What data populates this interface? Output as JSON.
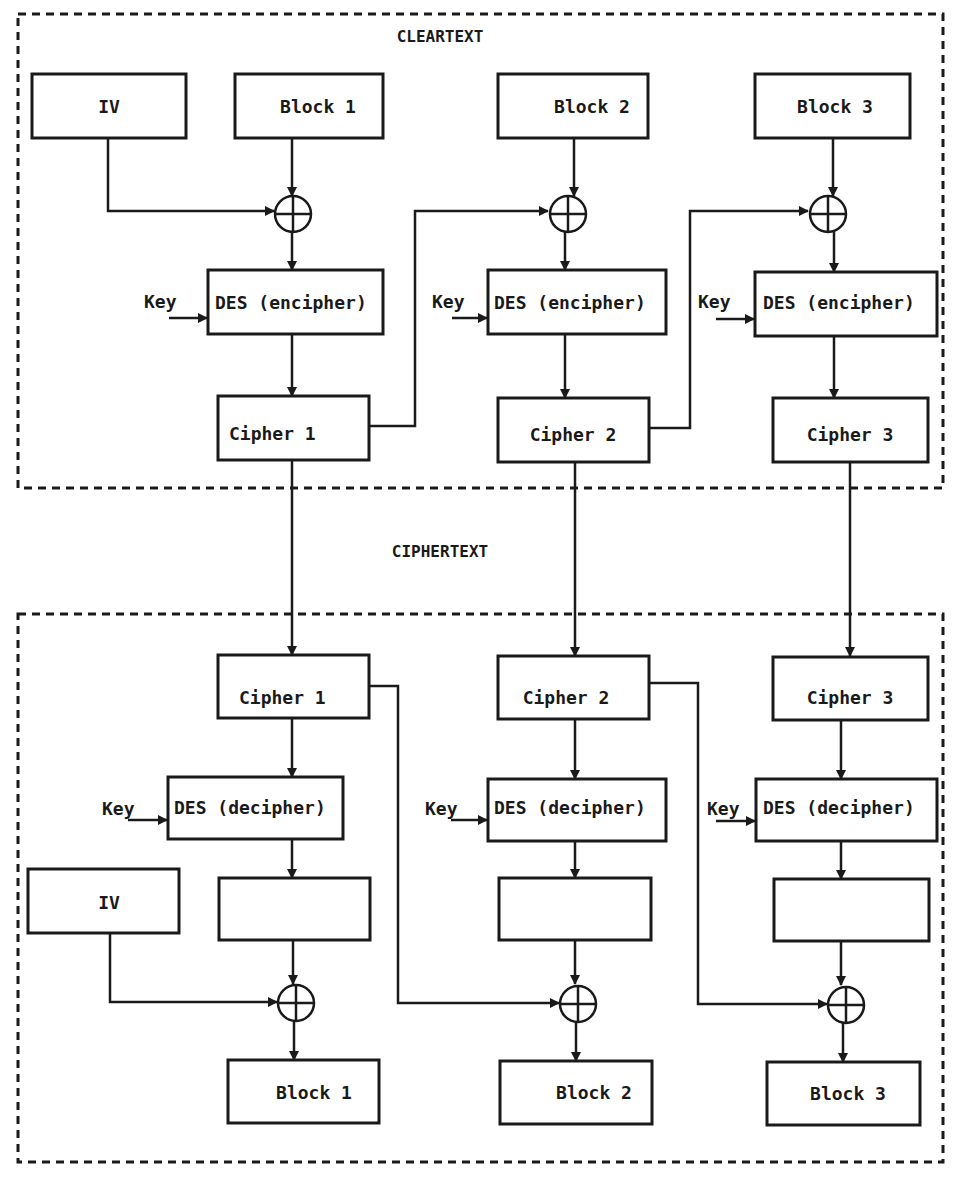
{
  "diagram": {
    "type": "CBC mode DES encipher / decipher",
    "colors": {
      "ink": "#1a1a1a",
      "background": "#ffffff"
    },
    "top_section": {
      "title": "CLEARTEXT",
      "iv_label": "IV",
      "blocks": [
        "Block 1",
        "Block 2",
        "Block 3"
      ],
      "key_labels": [
        "Key",
        "Key",
        "Key"
      ],
      "des_labels": [
        "DES (encipher)",
        "DES (encipher)",
        "DES (encipher)"
      ],
      "cipher_labels": [
        "Cipher 1",
        "Cipher 2",
        "Cipher 3"
      ]
    },
    "middle": {
      "title": "CIPHERTEXT"
    },
    "bottom_section": {
      "cipher_labels": [
        "Cipher 1",
        "Cipher 2",
        "Cipher 3"
      ],
      "key_labels": [
        "Key",
        "Key",
        "Key"
      ],
      "des_labels": [
        "DES (decipher)",
        "DES (decipher)",
        "DES (decipher)"
      ],
      "iv_label": "IV",
      "intermediate_labels": [
        "",
        "",
        ""
      ],
      "blocks": [
        "Block 1",
        "Block 2",
        "Block 3"
      ]
    },
    "icons": {
      "xor": "xor-circle-plus-icon",
      "arrow": "arrowhead-icon"
    }
  }
}
